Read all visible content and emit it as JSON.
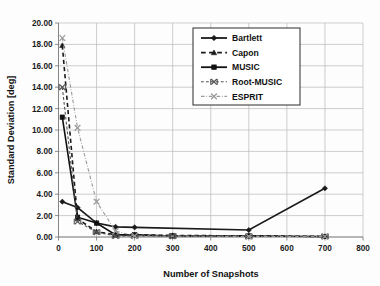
{
  "chart_data": {
    "type": "line",
    "title": "",
    "xlabel": "Number of Snapshots",
    "ylabel": "Standard  Deviation [deg]",
    "xlim": [
      0,
      800
    ],
    "ylim": [
      0,
      20
    ],
    "xticks": [
      0,
      100,
      200,
      300,
      400,
      500,
      600,
      700,
      800
    ],
    "xtick_labels": [
      "0",
      "100",
      "200",
      "300",
      "400",
      "500",
      "600",
      "700",
      "800"
    ],
    "yticks": [
      0,
      2,
      4,
      6,
      8,
      10,
      12,
      14,
      16,
      18,
      20
    ],
    "ytick_labels": [
      "0.00",
      "2.00",
      "4.00",
      "6.00",
      "8.00",
      "10.00",
      "12.00",
      "14.00",
      "16.00",
      "18.00",
      "20.00"
    ],
    "grid": true,
    "legend_position": "upper-center-right",
    "series": [
      {
        "name": "Bartlett",
        "marker": "diamond",
        "dash": "solid",
        "color": "#1a1a1a",
        "x": [
          10,
          50,
          100,
          150,
          200,
          500,
          700
        ],
        "y": [
          3.3,
          2.75,
          1.3,
          0.95,
          0.9,
          0.65,
          4.55
        ]
      },
      {
        "name": "Capon",
        "marker": "triangle",
        "dash": "dashed",
        "color": "#1a1a1a",
        "x": [
          10,
          50,
          100,
          150,
          200,
          300,
          500,
          700
        ],
        "y": [
          17.9,
          1.7,
          0.5,
          0.2,
          0.2,
          0.15,
          0.1,
          0.05
        ]
      },
      {
        "name": "MUSIC",
        "marker": "square",
        "dash": "solid",
        "color": "#111111",
        "x": [
          10,
          50,
          100,
          150,
          200,
          300,
          500,
          700
        ],
        "y": [
          11.2,
          1.85,
          1.3,
          0.2,
          0.2,
          0.1,
          0.1,
          0.05
        ]
      },
      {
        "name": "Root-MUSIC",
        "marker": "x-bar",
        "dash": "dashed",
        "color": "#555555",
        "x": [
          10,
          50,
          100,
          150,
          200,
          300,
          500,
          700
        ],
        "y": [
          14.0,
          1.45,
          0.45,
          0.1,
          0.1,
          0.08,
          0.05,
          0.05
        ]
      },
      {
        "name": "ESPRIT",
        "marker": "x",
        "dash": "dashdot",
        "color": "#9a9a9a",
        "x": [
          10,
          50,
          100,
          150,
          200,
          500,
          700
        ],
        "y": [
          18.6,
          10.2,
          3.3,
          0.55,
          0.1,
          0.05,
          0.05
        ]
      }
    ],
    "legend_entries": [
      {
        "label": "Bartlett",
        "marker": "diamond",
        "dash": "solid",
        "color": "#1a1a1a"
      },
      {
        "label": "Capon",
        "marker": "triangle",
        "dash": "dashed",
        "color": "#1a1a1a"
      },
      {
        "label": "MUSIC",
        "marker": "square",
        "dash": "solid",
        "color": "#111111"
      },
      {
        "label": "Root-MUSIC",
        "marker": "x-bar",
        "dash": "dashed",
        "color": "#555555"
      },
      {
        "label": "ESPRIT",
        "marker": "x",
        "dash": "dashdot",
        "color": "#9a9a9a"
      }
    ]
  }
}
